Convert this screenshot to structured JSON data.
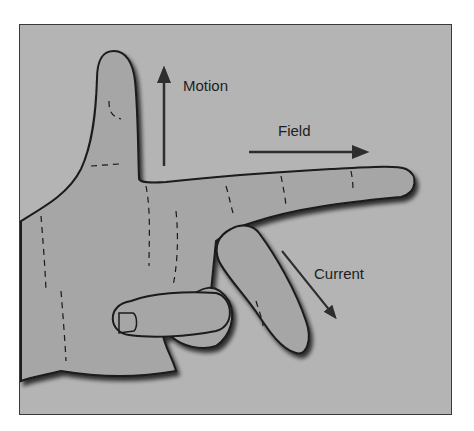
{
  "diagram": {
    "labels": {
      "motion": "Motion",
      "field": "Field",
      "current": "Current"
    },
    "colors": {
      "background": "#b4b4b4",
      "hand_fill": "#a6a6a6",
      "outline": "#1a1a1a",
      "arrow": "#2e2e2e",
      "frame_border": "#3a3a3a"
    },
    "arrows": [
      {
        "name": "motion",
        "direction": "up"
      },
      {
        "name": "field",
        "direction": "right"
      },
      {
        "name": "current",
        "direction": "down-right"
      }
    ]
  }
}
